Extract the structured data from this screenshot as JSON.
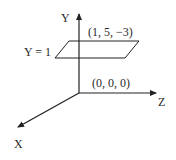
{
  "diagram": {
    "axes": {
      "y_label": "Y",
      "z_label": "Z",
      "x_label": "X"
    },
    "plane_label": "Y = 1",
    "point_label": "(1, 5, −3)",
    "origin_label": "(0, 0, 0)",
    "colors": {
      "stroke": "#222222",
      "text": "#2a2a2a",
      "background": "#ffffff"
    }
  }
}
